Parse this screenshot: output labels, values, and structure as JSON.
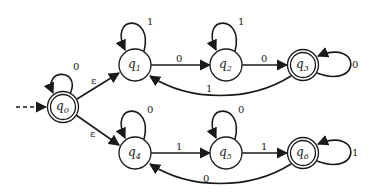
{
  "diagram": {
    "type": "nfa-state-diagram",
    "colors": {
      "stroke": "#1a1a1a",
      "fill": "#ffffff"
    },
    "start_state": "q0",
    "states": [
      {
        "id": "q0",
        "label": "q",
        "sub": "0",
        "x": 63,
        "y": 107,
        "accepting": true
      },
      {
        "id": "q1",
        "label": "q",
        "sub": "1",
        "x": 135,
        "y": 65,
        "accepting": false
      },
      {
        "id": "q2",
        "label": "q",
        "sub": "2",
        "x": 226,
        "y": 65,
        "accepting": false
      },
      {
        "id": "q3",
        "label": "q",
        "sub": "3",
        "x": 303,
        "y": 65,
        "accepting": true
      },
      {
        "id": "q4",
        "label": "q",
        "sub": "4",
        "x": 135,
        "y": 153,
        "accepting": false
      },
      {
        "id": "q5",
        "label": "q",
        "sub": "5",
        "x": 226,
        "y": 153,
        "accepting": false
      },
      {
        "id": "q6",
        "label": "q",
        "sub": "6",
        "x": 303,
        "y": 153,
        "accepting": true
      }
    ],
    "transitions": [
      {
        "from": "q0",
        "to": "q0",
        "symbol": "0"
      },
      {
        "from": "q0",
        "to": "q1",
        "symbol": "ε"
      },
      {
        "from": "q0",
        "to": "q4",
        "symbol": "ε"
      },
      {
        "from": "q1",
        "to": "q1",
        "symbol": "1"
      },
      {
        "from": "q1",
        "to": "q2",
        "symbol": "0"
      },
      {
        "from": "q2",
        "to": "q2",
        "symbol": "1"
      },
      {
        "from": "q2",
        "to": "q3",
        "symbol": "0"
      },
      {
        "from": "q3",
        "to": "q3",
        "symbol": "0"
      },
      {
        "from": "q3",
        "to": "q1",
        "symbol": "1"
      },
      {
        "from": "q4",
        "to": "q4",
        "symbol": "0"
      },
      {
        "from": "q4",
        "to": "q5",
        "symbol": "1"
      },
      {
        "from": "q5",
        "to": "q5",
        "symbol": "0"
      },
      {
        "from": "q5",
        "to": "q6",
        "symbol": "1"
      },
      {
        "from": "q6",
        "to": "q6",
        "symbol": "1"
      },
      {
        "from": "q6",
        "to": "q4",
        "symbol": "0"
      }
    ]
  }
}
